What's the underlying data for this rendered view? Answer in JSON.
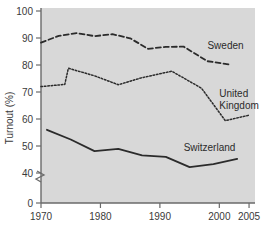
{
  "chart_data": {
    "type": "line",
    "title": "",
    "xlabel": "",
    "ylabel": "Turnout (%)",
    "xlim": [
      1970,
      2006
    ],
    "ylim": [
      0,
      100
    ],
    "y_axis_break": true,
    "y_break_between": [
      0,
      40
    ],
    "grid": false,
    "legend_position": "inline-labels",
    "plot_background": "#d8d8d8",
    "xticks": [
      1970,
      1980,
      1990,
      2000,
      2005
    ],
    "xtick_labels": [
      "1970",
      "1980",
      "1990",
      "2000",
      "2005"
    ],
    "yticks": [
      0,
      40,
      50,
      60,
      70,
      80,
      90,
      100
    ],
    "ytick_labels": [
      "0",
      "40",
      "50",
      "60",
      "70",
      "80",
      "90",
      "100"
    ],
    "series": [
      {
        "name": "Sweden",
        "style": "dashed",
        "color": "#2b2b2b",
        "label_x": 1998,
        "label_y": 86,
        "x": [
          1970,
          1973,
          1976,
          1979,
          1982,
          1985,
          1988,
          1991,
          1994,
          1998,
          2002
        ],
        "values": [
          88.3,
          90.8,
          91.8,
          90.7,
          91.4,
          89.9,
          86.0,
          86.7,
          86.8,
          81.4,
          80.1
        ]
      },
      {
        "name": "United Kingdom",
        "style": "dotted",
        "color": "#2b2b2b",
        "label_x": 2000,
        "label_y": 68,
        "label_lines": [
          "United",
          "Kingdom"
        ],
        "x": [
          1970,
          1974,
          1974.6,
          1979,
          1983,
          1987,
          1992,
          1997,
          2001,
          2005
        ],
        "values": [
          72.0,
          72.8,
          78.8,
          76.0,
          72.7,
          75.3,
          77.7,
          71.4,
          59.4,
          61.4
        ]
      },
      {
        "name": "Switzerland",
        "style": "solid",
        "color": "#2b2b2b",
        "label_x": 1994,
        "label_y": 48,
        "x": [
          1971,
          1975,
          1979,
          1983,
          1987,
          1991,
          1995,
          1999,
          2003
        ],
        "values": [
          56.0,
          52.4,
          48.1,
          48.9,
          46.5,
          46.0,
          42.2,
          43.3,
          45.2
        ]
      }
    ]
  }
}
